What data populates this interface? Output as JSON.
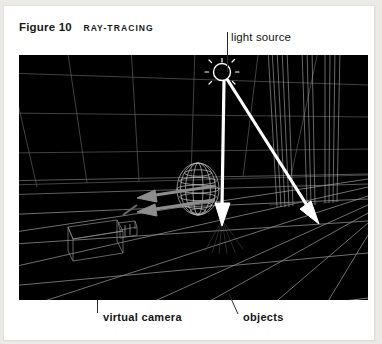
{
  "figure": {
    "number_label": "Figure 10",
    "subject_label": "RAY-TRACING"
  },
  "callouts": {
    "light_source": "light source",
    "virtual_camera": "virtual camera",
    "objects": "objects"
  },
  "scene": {
    "background_color": "#000000",
    "wireframe_color": "#9a9a9a",
    "grid_color": "#808080",
    "light_ray_color": "#ffffff",
    "view_ray_color": "#8d8d8d",
    "elements": [
      "ground-grid",
      "back-wall-grid",
      "wireframe-sphere",
      "wireframe-camera-box",
      "wireframe-columns",
      "light-source-symbol",
      "light-ray-to-sphere",
      "light-ray-to-columns",
      "view-ray-to-sphere",
      "view-ray-to-ground"
    ]
  },
  "page": {
    "paper_color": "#ffffff",
    "backdrop_color": "#eceae6"
  }
}
